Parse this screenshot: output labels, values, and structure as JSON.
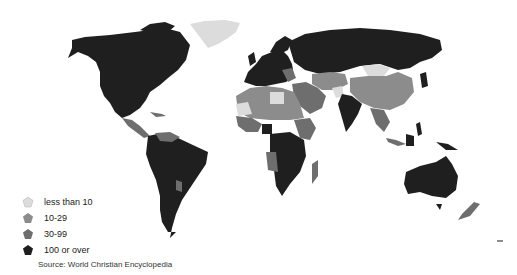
{
  "map": {
    "colors": {
      "lt10": "#dcdcdc",
      "c10_29": "#8c8c8c",
      "c30_99": "#6e6e6e",
      "c100": "#1f1f1f",
      "border": "#ffffff"
    }
  },
  "legend": {
    "items": [
      {
        "label": "less than 10",
        "color": "#dcdcdc"
      },
      {
        "label": "10-29",
        "color": "#8c8c8c"
      },
      {
        "label": "30-99",
        "color": "#6e6e6e"
      },
      {
        "label": "100 or over",
        "color": "#1f1f1f"
      }
    ]
  },
  "source": "Source: World Christian Encyclopedia"
}
